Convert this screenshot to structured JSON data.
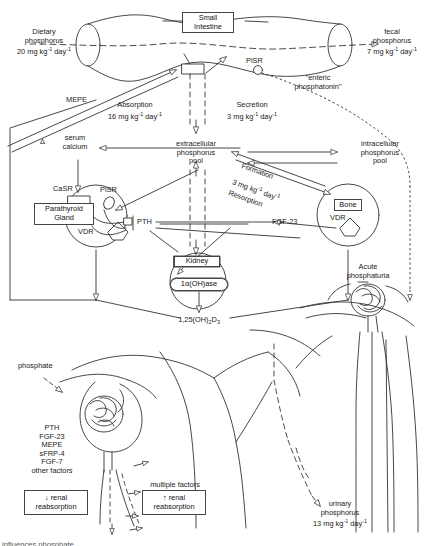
{
  "figure": {
    "type": "biomedical-pathway-diagram",
    "width": 428,
    "height": 546,
    "stroke_color": "#333333",
    "background": "#ffffff"
  },
  "intestine": {
    "organ_label_line1": "Small",
    "organ_label_line2": "Intestine",
    "dietary": {
      "line1": "Dietary",
      "line2": "phosphorus",
      "value": "20 mg kg",
      "exp1": "-1",
      "unit2": " day",
      "exp2": "-1"
    },
    "fecal": {
      "line1": "fecal",
      "line2": "phosphorus",
      "value": "7 mg kg",
      "exp1": "-1",
      "unit2": " day",
      "exp2": "-1"
    },
    "pisr_label": "PiSR",
    "phosphatonin_line1": "\"enteric",
    "phosphatonin_line2": "phosphatonin\"",
    "mepe_label": "MEPE",
    "absorption": {
      "label": "Absorption",
      "value": "16 mg kg",
      "exp1": "-1",
      "unit2": " day",
      "exp2": "-1"
    },
    "secretion": {
      "label": "Secretion",
      "value": "3 mg kg",
      "exp1": "-1",
      "unit2": " day",
      "exp2": "-1"
    }
  },
  "pools": {
    "extracellular": {
      "line1": "extracellular",
      "line2": "phosphorus",
      "line3": "pool"
    },
    "intracellular": {
      "line1": "intracellular",
      "line2": "phosphorus",
      "line3": "pool"
    },
    "serum_calcium": {
      "delta": "Δ",
      "line1": "serum",
      "line2": "calcium"
    }
  },
  "parathyroid": {
    "gland_line1": "Parathyroid",
    "gland_line2": "Gland",
    "casr_label": "CaSR",
    "pisr_label": "PiSR",
    "vdr_label": "VDR",
    "pth_label": "PTH"
  },
  "bone": {
    "organ_label": "Bone",
    "vdr_label": "VDR",
    "formation_label": "Formation",
    "resorption_label": "Resorption",
    "flux_value": "3 mg kg",
    "flux_exp1": "-1",
    "flux_unit2": " day",
    "flux_exp2": "-1",
    "fgf23_label": "FGF-23"
  },
  "kidney": {
    "organ_label": "Kidney",
    "enzyme_label": "1α(OH)ase",
    "vitamin_d_main": "1,25(OH)",
    "vitamin_d_sub": "2",
    "vitamin_d_tail": "D",
    "vitamin_d_sub2": "3",
    "acute_line1": "Acute",
    "acute_line2": "phosphaturia"
  },
  "nephron_left": {
    "phosphate_label": "phosphate",
    "factors": [
      "PTH",
      "FGF-23",
      "MEPE",
      "sFRP-4",
      "FGF-7",
      "other factors"
    ],
    "effect_arrow": "↓",
    "effect_line1": "renal",
    "effect_line2": "reabsorption"
  },
  "nephron_mid": {
    "factors_label": "multiple factors",
    "effect_arrow": "↑",
    "effect_line1": "renal",
    "effect_line2": "reabsorption"
  },
  "urine": {
    "line1": "urinary",
    "line2": "phosphorus",
    "value": "13 mg kg",
    "exp1": "-1",
    "unit2": " day",
    "exp2": "-1"
  },
  "caption": {
    "text": "influences phosphate"
  }
}
